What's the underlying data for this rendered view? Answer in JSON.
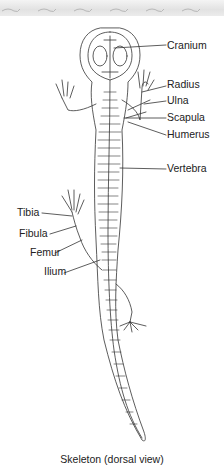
{
  "figure": {
    "caption": "Skeleton (dorsal view)",
    "labels_right": [
      {
        "text": "Cranium",
        "y": 45
      },
      {
        "text": "Radius",
        "y": 84
      },
      {
        "text": "Ulna",
        "y": 100
      },
      {
        "text": "Scapula",
        "y": 117
      },
      {
        "text": "Humerus",
        "y": 134
      },
      {
        "text": "Vertebra",
        "y": 168
      }
    ],
    "labels_left": [
      {
        "text": "Tibia",
        "y": 212
      },
      {
        "text": "Fibula",
        "y": 233
      },
      {
        "text": "Femur",
        "y": 252
      },
      {
        "text": "Ilium",
        "y": 271
      }
    ]
  },
  "labels": {
    "cranium": "Cranium",
    "radius": "Radius",
    "ulna": "Ulna",
    "scapula": "Scapula",
    "humerus": "Humerus",
    "vertebra": "Vertebra",
    "tibia": "Tibia",
    "fibula": "Fibula",
    "femur": "Femur",
    "ilium": "Ilium"
  },
  "colors": {
    "line": "#333333",
    "text": "#222222",
    "banner": "#e6e6e6"
  }
}
